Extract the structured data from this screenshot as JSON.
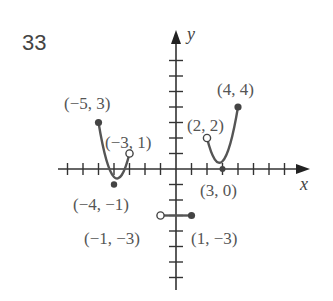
{
  "problem_number": "33",
  "chart_data": {
    "type": "line",
    "title": "",
    "xlabel": "x",
    "ylabel": "y",
    "xlim": [
      -6,
      8
    ],
    "ylim": [
      -7,
      7
    ],
    "grid": false,
    "tick_spacing": 1,
    "series": [
      {
        "name": "left-parabola",
        "shape": "parabola",
        "vertex": [
          -4,
          -1
        ],
        "start": [
          -5,
          3
        ],
        "end": [
          -3,
          1
        ],
        "start_closed": true,
        "end_closed": false
      },
      {
        "name": "horizontal-segment",
        "shape": "segment",
        "start": [
          -1,
          -3
        ],
        "end": [
          1,
          -3
        ],
        "start_closed": false,
        "end_closed": true
      },
      {
        "name": "right-parabola",
        "shape": "parabola",
        "vertex": [
          3,
          0
        ],
        "start": [
          2,
          2
        ],
        "end": [
          4,
          4
        ],
        "start_closed": false,
        "end_closed": true
      }
    ],
    "annotations": [
      {
        "text": "(−5, 3)",
        "point": [
          -5,
          3
        ]
      },
      {
        "text": "(−3, 1)",
        "point": [
          -3,
          1
        ]
      },
      {
        "text": "(−4, −1)",
        "point": [
          -4,
          -1
        ]
      },
      {
        "text": "(−1, −3)",
        "point": [
          -1,
          -3
        ]
      },
      {
        "text": "(1, −3)",
        "point": [
          1,
          -3
        ]
      },
      {
        "text": "(2, 2)",
        "point": [
          2,
          2
        ]
      },
      {
        "text": "(4, 4)",
        "point": [
          4,
          4
        ]
      },
      {
        "text": "(3, 0)",
        "point": [
          3,
          0
        ]
      }
    ]
  },
  "labels": {
    "x_axis": "x",
    "y_axis": "y",
    "p_m5_3": "(−5, 3)",
    "p_m3_1": "(−3, 1)",
    "p_m4_m1": "(−4, −1)",
    "p_m1_m3": "(−1, −3)",
    "p_1_m3": "(1, −3)",
    "p_2_2": "(2, 2)",
    "p_4_4": "(4, 4)",
    "p_3_0": "(3, 0)"
  }
}
